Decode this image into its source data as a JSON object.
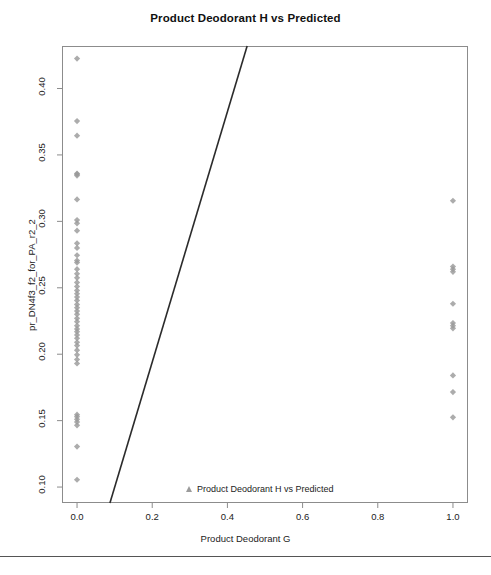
{
  "chart_data": {
    "type": "scatter",
    "title": "Product Deodorant H  vs Predicted",
    "xlabel": "Product Deodorant G",
    "ylabel": "pr_DN4f3_f2_for_PA_r2_2",
    "xlim": [
      -0.04,
      1.04
    ],
    "ylim": [
      0.088,
      0.432
    ],
    "xticks": [
      0.0,
      0.2,
      0.4,
      0.6,
      0.8,
      1.0
    ],
    "xticklabels": [
      "0.0",
      "0.2",
      "0.4",
      "0.6",
      "0.8",
      "1.0"
    ],
    "yticks": [
      0.1,
      0.15,
      0.2,
      0.25,
      0.3,
      0.35,
      0.4
    ],
    "yticklabels": [
      "0.10",
      "0.15",
      "0.20",
      "0.25",
      "0.30",
      "0.35",
      "0.40"
    ],
    "grid": false,
    "legend_position": "bottom-center",
    "legend": [
      {
        "label": "Product Deodorant H vs Predicted",
        "marker": "triangle",
        "color": "#7a7a7a"
      }
    ],
    "marker_color": "#9a9a9a",
    "marker_shape": "diamond",
    "series": [
      {
        "name": "Product Deodorant H vs Predicted",
        "x": [
          0.0,
          0.0,
          0.0,
          0.0,
          0.0,
          0.0,
          0.0,
          0.0,
          0.0,
          0.0,
          0.0,
          0.0,
          0.0,
          0.0,
          0.0,
          0.0,
          0.0,
          0.0,
          0.0,
          0.0,
          0.0,
          0.0,
          0.0,
          0.0,
          0.0,
          0.0,
          0.0,
          0.0,
          0.0,
          0.0,
          0.0,
          0.0,
          0.0,
          0.0,
          0.0,
          0.0,
          0.0,
          0.0,
          0.0,
          0.0,
          0.0,
          0.0,
          0.0,
          0.0,
          0.0,
          0.0,
          0.0,
          0.0,
          1.0,
          1.0,
          1.0,
          1.0,
          1.0,
          1.0,
          1.0,
          1.0,
          1.0,
          1.0,
          1.0
        ],
        "y": [
          0.4225,
          0.3755,
          0.3645,
          0.336,
          0.3355,
          0.3345,
          0.3165,
          0.301,
          0.2985,
          0.293,
          0.2835,
          0.28,
          0.2745,
          0.2705,
          0.269,
          0.264,
          0.2605,
          0.2575,
          0.254,
          0.251,
          0.248,
          0.2455,
          0.243,
          0.2405,
          0.2375,
          0.235,
          0.2325,
          0.23,
          0.227,
          0.2245,
          0.2215,
          0.219,
          0.217,
          0.2145,
          0.212,
          0.209,
          0.2065,
          0.203,
          0.1995,
          0.196,
          0.193,
          0.1545,
          0.153,
          0.151,
          0.149,
          0.1465,
          0.1305,
          0.1055,
          0.3155,
          0.266,
          0.264,
          0.262,
          0.238,
          0.2235,
          0.2215,
          0.2195,
          0.184,
          0.1715,
          0.1525
        ]
      }
    ],
    "fit_line": {
      "name": "regression-line",
      "color": "#2b2b2b",
      "x_start": 0.0875,
      "y_start": 0.088,
      "x_end": 0.4525,
      "y_end": 0.432
    }
  },
  "footer": {
    "subtext": ""
  }
}
